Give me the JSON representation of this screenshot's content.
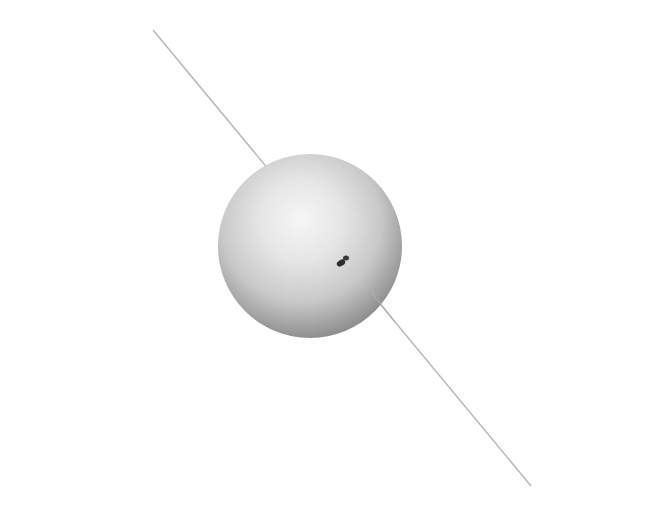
{
  "figure": {
    "width": 649,
    "height": 514,
    "background": "#ffffff",
    "axis_line": {
      "x1": 153,
      "y1": 30,
      "x2": 531,
      "y2": 486,
      "color": "#b8b8b8",
      "width": 1.5
    },
    "sphere": {
      "cx": 310,
      "cy": 246,
      "r": 92,
      "highlight_color": "#f7f7f7",
      "mid_color": "#d9d9d9",
      "edge_color": "#8f8f8f"
    },
    "spot": {
      "cx": 343,
      "cy": 260,
      "color": "#2e2e2e"
    }
  }
}
